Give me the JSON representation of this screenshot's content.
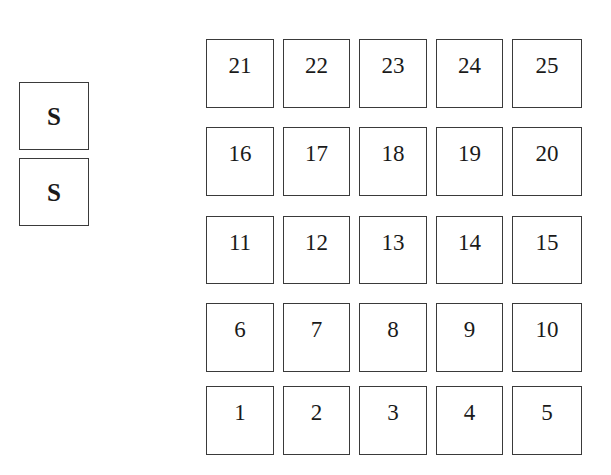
{
  "side_boxes": [
    "S",
    "S"
  ],
  "grid": {
    "rows": [
      [
        "21",
        "22",
        "23",
        "24",
        "25"
      ],
      [
        "16",
        "17",
        "18",
        "19",
        "20"
      ],
      [
        "11",
        "12",
        "13",
        "14",
        "15"
      ],
      [
        "6",
        "7",
        "8",
        "9",
        "10"
      ],
      [
        "1",
        "2",
        "3",
        "4",
        "5"
      ]
    ]
  }
}
